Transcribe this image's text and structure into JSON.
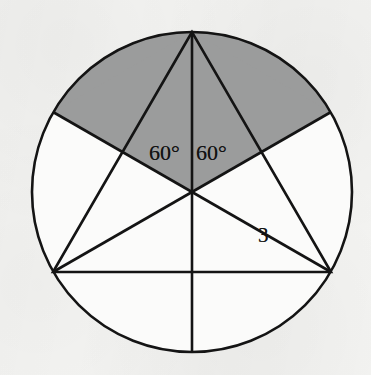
{
  "figure": {
    "background_color": "#f4f4f2",
    "stroke_color": "#141414",
    "shaded_fill_color": "#9b9c9c",
    "unshaded_fill_color": "#fbfbfa"
  },
  "circle": {
    "center_x": 192,
    "center_y": 192,
    "radius": 160,
    "stroke_width": 2.6
  },
  "triangle": {
    "vertices": [
      {
        "name": "top",
        "x": 192,
        "y": 32
      },
      {
        "name": "bottom-left",
        "x": 53,
        "y": 272
      },
      {
        "name": "bottom-right",
        "x": 331,
        "y": 272
      }
    ],
    "stroke_width": 2.6
  },
  "chord_endpoints": [
    {
      "name": "upper-left",
      "x": 53,
      "y": 112
    },
    {
      "name": "upper-right",
      "x": 331,
      "y": 112
    }
  ],
  "bottom_point": {
    "name": "bottom",
    "x": 192,
    "y": 352
  },
  "radii": [
    {
      "name": "radius-to-top-vertex",
      "angle_deg": 90
    },
    {
      "name": "radius-to-upper-left-chord",
      "angle_deg": 150
    },
    {
      "name": "radius-to-bottom-left-vertex",
      "angle_deg": 210
    },
    {
      "name": "radius-to-bottom-point",
      "angle_deg": 270
    },
    {
      "name": "radius-to-bottom-right-vertex",
      "angle_deg": 330
    },
    {
      "name": "radius-to-upper-right-chord",
      "angle_deg": 30
    }
  ],
  "labels": {
    "angle_left": "60°",
    "angle_right": "60°",
    "side_length": "3"
  }
}
